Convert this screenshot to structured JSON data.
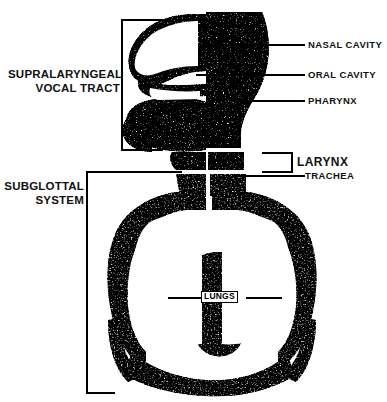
{
  "figure": {
    "background_color": "#ffffff",
    "ink_color": "#000000",
    "render_style": "stipple"
  },
  "group_labels": [
    {
      "id": "supralaryngeal",
      "line1": "SUPRALARYNGEAL",
      "line2": "VOCAL TRACT",
      "bracket": "left"
    },
    {
      "id": "subglottal",
      "line1": "SUBGLOTTAL",
      "line2": "SYSTEM",
      "bracket": "left"
    }
  ],
  "callouts": [
    {
      "id": "nasal-cavity",
      "text": "NASAL CAVITY",
      "connector": "leader-line"
    },
    {
      "id": "oral-cavity",
      "text": "ORAL CAVITY",
      "connector": "leader-line"
    },
    {
      "id": "pharynx",
      "text": "PHARYNX",
      "connector": "leader-line"
    },
    {
      "id": "larynx",
      "text": "LARYNX",
      "connector": "bracket"
    },
    {
      "id": "trachea",
      "text": "TRACHEA",
      "connector": "leader-line"
    },
    {
      "id": "lungs",
      "text": "LUNGS",
      "connector": "boxed-leader"
    }
  ]
}
